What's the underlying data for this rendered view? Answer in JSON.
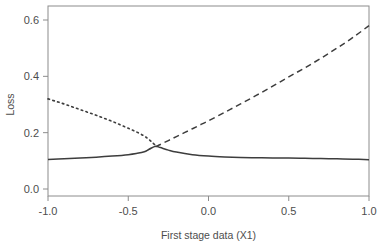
{
  "figure": {
    "background_color": "#ffffff",
    "line_color": "#3d3d3d",
    "axis_color": "#8c8c8c",
    "text_color": "#4d4d4d"
  },
  "chart_data": {
    "type": "line",
    "title": "",
    "xlabel": "First stage data (X1)",
    "ylabel": "Loss",
    "xlim": [
      -1.0,
      1.0
    ],
    "ylim": [
      0.0,
      0.63
    ],
    "grid": false,
    "legend": "none",
    "xticks": [
      "-1.0",
      "-0.5",
      "0.0",
      "0.5",
      "1.0"
    ],
    "xtick_values": [
      -1.0,
      -0.5,
      0.0,
      0.5,
      1.0
    ],
    "yticks": [
      "0.0",
      "0.2",
      "0.4",
      "0.6"
    ],
    "ytick_values": [
      0.0,
      0.2,
      0.4,
      0.6
    ],
    "series": [
      {
        "name": "dotted-series",
        "linestyle": "dotted",
        "x": [
          -1.0,
          -0.95,
          -0.9,
          -0.85,
          -0.8,
          -0.75,
          -0.7,
          -0.65,
          -0.6,
          -0.55,
          -0.5,
          -0.45,
          -0.4,
          -0.37,
          -0.35,
          -0.33
        ],
        "values": [
          0.32,
          0.311,
          0.302,
          0.292,
          0.282,
          0.272,
          0.262,
          0.251,
          0.24,
          0.228,
          0.216,
          0.203,
          0.188,
          0.175,
          0.165,
          0.155
        ]
      },
      {
        "name": "dashed-series",
        "linestyle": "dashed",
        "x": [
          -0.33,
          -0.3,
          -0.25,
          -0.2,
          -0.15,
          -0.1,
          -0.05,
          0.0,
          0.1,
          0.2,
          0.3,
          0.4,
          0.5,
          0.6,
          0.7,
          0.8,
          0.9,
          1.0
        ],
        "values": [
          0.15,
          0.158,
          0.172,
          0.186,
          0.2,
          0.214,
          0.228,
          0.242,
          0.272,
          0.302,
          0.333,
          0.365,
          0.398,
          0.43,
          0.464,
          0.5,
          0.538,
          0.58
        ]
      },
      {
        "name": "solid-series",
        "linestyle": "solid",
        "x": [
          -1.0,
          -0.9,
          -0.8,
          -0.7,
          -0.6,
          -0.5,
          -0.45,
          -0.4,
          -0.37,
          -0.33,
          -0.3,
          -0.25,
          -0.2,
          -0.1,
          0.0,
          0.1,
          0.2,
          0.3,
          0.4,
          0.5,
          0.6,
          0.7,
          0.8,
          0.9,
          1.0
        ],
        "values": [
          0.105,
          0.107,
          0.11,
          0.113,
          0.117,
          0.122,
          0.126,
          0.132,
          0.141,
          0.152,
          0.147,
          0.138,
          0.131,
          0.122,
          0.117,
          0.114,
          0.112,
          0.111,
          0.11,
          0.11,
          0.109,
          0.108,
          0.107,
          0.106,
          0.104
        ]
      }
    ]
  }
}
